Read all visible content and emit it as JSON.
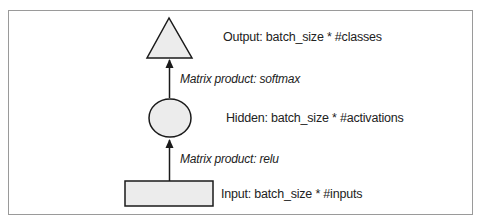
{
  "diagram": {
    "nodes": [
      {
        "id": "output",
        "shape": "triangle",
        "label": "Output: batch_size * #classes"
      },
      {
        "id": "hidden",
        "shape": "ellipse",
        "label": "Hidden: batch_size * #activations"
      },
      {
        "id": "input",
        "shape": "rectangle",
        "label": "Input: batch_size * #inputs"
      }
    ],
    "edges": [
      {
        "from": "hidden",
        "to": "output",
        "label": "Matrix product: softmax"
      },
      {
        "from": "input",
        "to": "hidden",
        "label": "Matrix product: relu"
      }
    ],
    "colors": {
      "node_fill": "#ececec",
      "node_stroke": "#1a1a1a",
      "frame": "#9a9a9a"
    }
  }
}
